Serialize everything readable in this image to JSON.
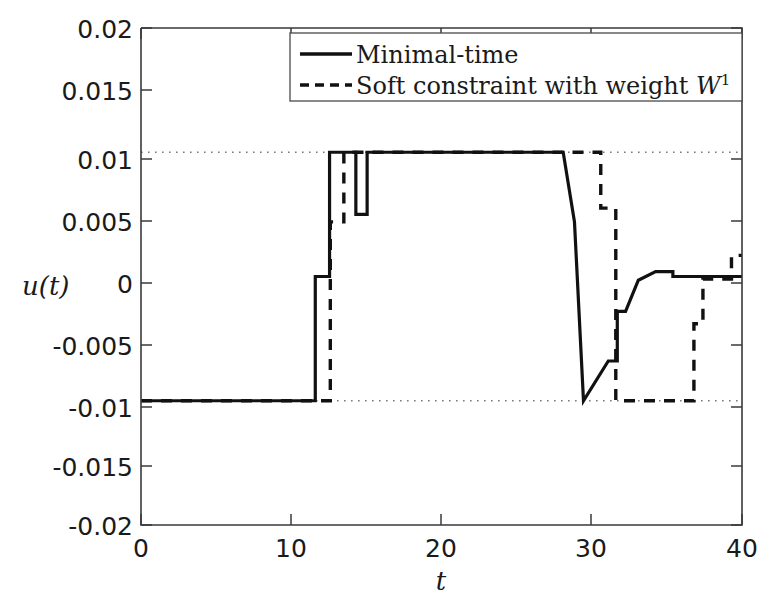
{
  "chart_data": {
    "type": "line",
    "title": "",
    "xlabel": "t",
    "ylabel": "u(t)",
    "xlim": [
      0,
      40
    ],
    "ylim": [
      -0.02,
      0.02
    ],
    "xticks": [
      0,
      10,
      20,
      30,
      40
    ],
    "xtick_labels": [
      "0",
      "10",
      "20",
      "30",
      "40"
    ],
    "yticks": [
      0.02,
      0.015,
      0.01,
      0.005,
      0,
      -0.005,
      -0.01,
      -0.015,
      -0.02
    ],
    "ytick_labels": [
      "0.02",
      "0.015",
      "0.01",
      "0.005",
      "0",
      "-0.005",
      "-0.01",
      "-0.015",
      "-0.02"
    ],
    "grid": "horizontal dotted lines at y = 0.01 and y = -0.01",
    "gridlines_y": [
      0.01,
      -0.01
    ],
    "legend_position": "top-right inside axes",
    "series": [
      {
        "name": "Minimal-time",
        "style": "solid",
        "color": "#111111",
        "drawstyle": "steps-post",
        "x": [
          0,
          11.6,
          11.6,
          12.55,
          12.55,
          14.3,
          14.3,
          15.05,
          15.05,
          28.1,
          28.1,
          28.85,
          28.85,
          29.45,
          29.45,
          31.1,
          31.1,
          31.7,
          31.7,
          32.25,
          32.25,
          33.1,
          33.1,
          34.25,
          34.25,
          35.4,
          35.4,
          40
        ],
        "y": [
          -0.01,
          -0.01,
          0.0,
          0.0,
          0.01,
          0.01,
          0.005,
          0.005,
          0.01,
          0.01,
          0.01,
          0.0044,
          0.0044,
          -0.01,
          -0.01,
          -0.0068,
          -0.0068,
          -0.0068,
          -0.0028,
          -0.0028,
          -0.0028,
          -0.0003,
          -0.0003,
          0.0004,
          0.0004,
          0.0004,
          0.0,
          0.0
        ]
      },
      {
        "name": "Soft constraint with weight W",
        "name_superscript": "1",
        "style": "dashed",
        "color": "#111111",
        "drawstyle": "steps-post",
        "x": [
          0,
          12.6,
          12.6,
          13.5,
          13.5,
          30.6,
          30.6,
          31.6,
          31.6,
          32.2,
          32.2,
          36.8,
          36.8,
          37.4,
          37.4,
          39.3,
          39.3,
          40
        ],
        "y": [
          -0.01,
          -0.01,
          0.0044,
          0.0044,
          0.01,
          0.01,
          0.0055,
          0.0055,
          -0.01,
          -0.01,
          -0.01,
          -0.01,
          -0.0038,
          -0.0038,
          -0.0002,
          -0.0002,
          0.0017,
          0.0017
        ]
      }
    ],
    "legend_entries": [
      {
        "label": "Minimal-time",
        "style": "solid"
      },
      {
        "label_prefix": "Soft constraint with weight ",
        "label_symbol": "W",
        "label_superscript": "1",
        "style": "dashed"
      }
    ]
  }
}
